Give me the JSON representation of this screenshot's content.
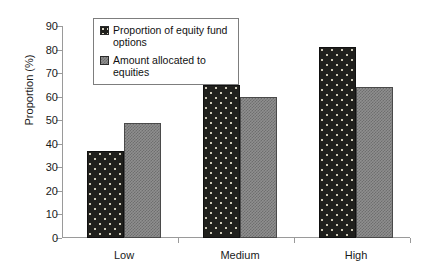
{
  "chart_data": {
    "type": "bar",
    "title": "",
    "xlabel": "",
    "ylabel": "Proportion (%)",
    "categories": [
      "Low",
      "Medium",
      "High"
    ],
    "series": [
      {
        "name": "Proportion of equity fund options",
        "values": [
          37,
          65,
          81
        ],
        "color": "#20201d",
        "pattern": "dark-speckled"
      },
      {
        "name": "Amount allocated to equities",
        "values": [
          49,
          60,
          64
        ],
        "color": "#8f8f8f",
        "pattern": "gray-checkered"
      }
    ],
    "ylim": [
      0,
      90
    ],
    "yticks": [
      0,
      10,
      20,
      30,
      40,
      50,
      60,
      70,
      80,
      90
    ],
    "ytick_labels": [
      "0",
      "10",
      "20",
      "30",
      "40",
      "50",
      "60",
      "70",
      "80",
      "90"
    ],
    "grid": false,
    "legend_position": "top-center-inside"
  },
  "legend": {
    "entries": [
      {
        "label": "Proportion of equity fund options",
        "swatch_name": "legend-swatch-dark"
      },
      {
        "label": "Amount allocated to equities",
        "swatch_name": "legend-swatch-gray"
      }
    ]
  }
}
